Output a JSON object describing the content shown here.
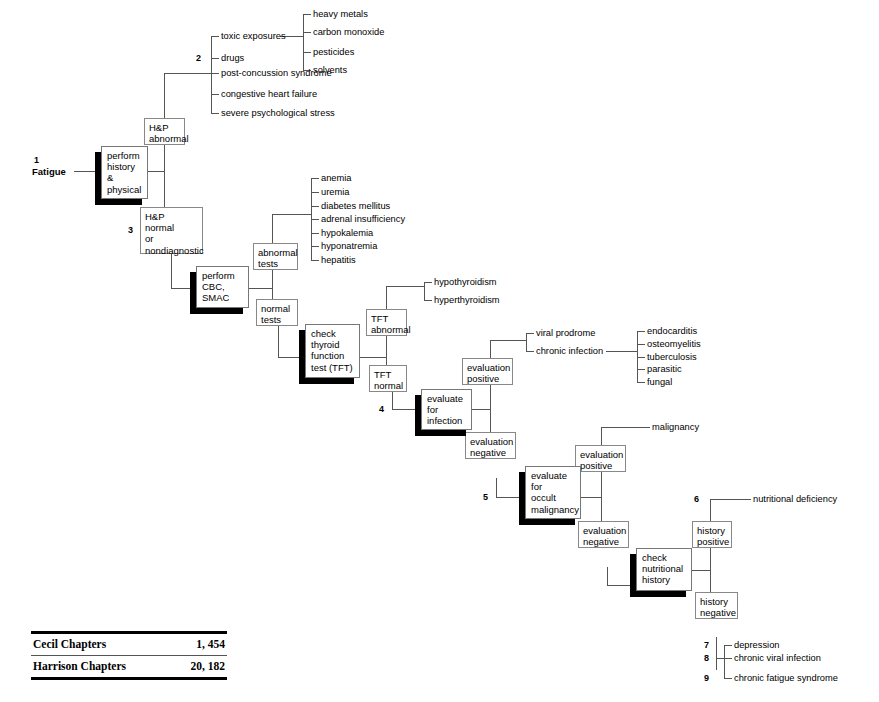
{
  "diagram": {
    "root": {
      "number": "1",
      "label": "Fatigue"
    },
    "nodes": {
      "perform_history_physical": "perform\nhistory\n&\nphysical",
      "hp_abnormal": "H&P\nabnormal",
      "hp_normal": "H&P\nnormal\nor\nnondiagnostic",
      "perform_cbc_smac": "perform\nCBC,\nSMAC",
      "abnormal_tests": "abnormal\ntests",
      "normal_tests": "normal\ntests",
      "check_thyroid": "check\nthyroid\nfunction\ntest (TFT)",
      "tft_abnormal": "TFT\nabnormal",
      "tft_normal": "TFT\nnormal",
      "evaluate_for_infection": "evaluate\nfor\ninfection",
      "infection_eval_positive": "evaluation\npositive",
      "infection_eval_negative": "evaluation\nnegative",
      "evaluate_occult_malignancy": "evaluate\nfor\noccult\nmalignancy",
      "malignancy_eval_positive": "evaluation\npositive",
      "malignancy_eval_negative": "evaluation\nnegative",
      "check_nutritional_history": "check\nnutritional\nhistory",
      "history_positive": "history\npositive",
      "history_negative": "history\nnegative"
    },
    "node_lines": {
      "perform_history_physical": [
        "perform",
        "history",
        "&",
        "physical"
      ],
      "hp_abnormal": [
        "H&P",
        "abnormal"
      ],
      "hp_normal": [
        "H&P",
        "normal",
        "or",
        "nondiagnostic"
      ],
      "perform_cbc_smac": [
        "perform",
        "CBC,",
        "SMAC"
      ],
      "abnormal_tests": [
        "abnormal",
        "tests"
      ],
      "normal_tests": [
        "normal",
        "tests"
      ],
      "check_thyroid": [
        "check",
        "thyroid",
        "function",
        "test (TFT)"
      ],
      "tft_abnormal": [
        "TFT",
        "abnormal"
      ],
      "tft_normal": [
        "TFT",
        "normal"
      ],
      "evaluate_for_infection": [
        "evaluate",
        "for",
        "infection"
      ],
      "infection_eval_positive": [
        "evaluation",
        "positive"
      ],
      "infection_eval_negative": [
        "evaluation",
        "negative"
      ],
      "evaluate_occult_malignancy": [
        "evaluate",
        "for",
        "occult",
        "malignancy"
      ],
      "malignancy_eval_positive": [
        "evaluation",
        "positive"
      ],
      "malignancy_eval_negative": [
        "evaluation",
        "negative"
      ],
      "check_nutritional_history": [
        "check",
        "nutritional",
        "history"
      ],
      "history_positive": [
        "history",
        "positive"
      ],
      "history_negative": [
        "history",
        "negative"
      ]
    },
    "leaves": {
      "hp_abnormal_causes": [
        "toxic exposures",
        "drugs",
        "post-concussion syndrome",
        "congestive heart failure",
        "severe psychological stress"
      ],
      "toxic_exposure_types": [
        "heavy metals",
        "carbon monoxide",
        "pesticides",
        "solvents"
      ],
      "abnormal_test_causes": [
        "anemia",
        "uremia",
        "diabetes mellitus",
        "adrenal insufficiency",
        "hypokalemia",
        "hyponatremia",
        "hepatitis"
      ],
      "tft_abnormal_results": [
        "hypothyroidism",
        "hyperthyroidism"
      ],
      "infection_results": [
        "viral prodrome",
        "chronic infection"
      ],
      "chronic_infection_types": [
        "endocarditis",
        "osteomyelitis",
        "tuberculosis",
        "parasitic",
        "fungal"
      ],
      "malignancy_result": "malignancy",
      "nutritional_result": "nutritional deficiency",
      "history_negative_results": [
        "depression",
        "chronic viral infection",
        "chronic fatigue syndrome"
      ]
    },
    "key_numbers": {
      "n1": "1",
      "n2": "2",
      "n3": "3",
      "n4": "4",
      "n5": "5",
      "n6": "6",
      "n7": "7",
      "n8": "8",
      "n9": "9"
    }
  },
  "chapters_table": {
    "rows": [
      {
        "source": "Cecil Chapters",
        "chapters": "1, 454"
      },
      {
        "source": "Harrison Chapters",
        "chapters": "20, 182"
      }
    ]
  },
  "colors": {
    "ink": "#000000",
    "box_border": "#777777",
    "wire": "#555555",
    "background": "#ffffff"
  }
}
